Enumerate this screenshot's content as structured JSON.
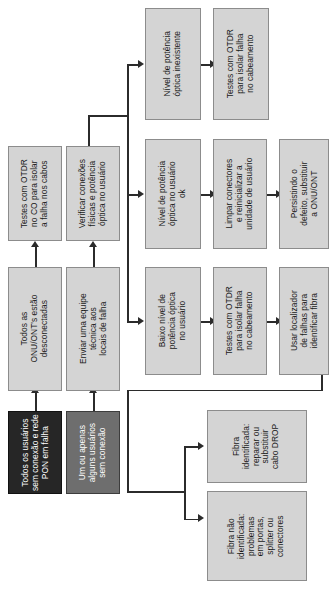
{
  "diagram": {
    "orientation": "rotated-90",
    "colors": {
      "node_fill": "#d4d4d4",
      "node_border": "#8c8c8c",
      "start_primary_fill": "#262626",
      "start_secondary_fill": "#6e6e6e",
      "connector": "#2b2b2b",
      "text_dark": "#1a1a1a",
      "text_light": "#ffffff"
    },
    "nodes": [
      {
        "id": "start-all-users",
        "style": "dark",
        "text": "Todos os usuários\nsem conexão e rede\nPON em falha"
      },
      {
        "id": "start-some-users",
        "style": "mid",
        "text": "Um ou apenas\nalguns usuários\nsem conexão"
      },
      {
        "id": "all-onu-disconnected",
        "style": "normal",
        "text": "Todos as\nONU/ONT's estão\ndesconectadas"
      },
      {
        "id": "send-technical-team",
        "style": "normal",
        "text": "Enviar uma equipe\ntécnica aos\nlocais de falha"
      },
      {
        "id": "otdr-co-tests",
        "style": "normal",
        "text": "Testes com OTDR\nno CO para isolar\na falha nos cabos"
      },
      {
        "id": "check-connections",
        "style": "normal",
        "text": "Verificar conexões\nfísicas e potência\nóptica no usuário"
      },
      {
        "id": "power-nonexistent",
        "style": "normal",
        "text": "Nível de potência\nóptica inexistente"
      },
      {
        "id": "otdr-cabling-tests-a",
        "style": "normal",
        "text": "Testes com OTDR\npara isolar falha\nno cabeamento"
      },
      {
        "id": "power-ok",
        "style": "normal",
        "text": "Nível de potência\nóptica no usuário\nok"
      },
      {
        "id": "clean-connectors",
        "style": "normal",
        "text": "Limpar conectores\ne reinicializar a\nunidade de usuário"
      },
      {
        "id": "replace-onu",
        "style": "normal",
        "text": "Persistindo o\ndefeito, substituir\na ONU/ONT"
      },
      {
        "id": "low-power",
        "style": "normal",
        "text": "Baixo nível de\npotência óptica\nno usuário"
      },
      {
        "id": "otdr-cabling-tests-b",
        "style": "normal",
        "text": "Testes com OTDR\npara isolar falha\nno cabeamento"
      },
      {
        "id": "fault-locator",
        "style": "normal",
        "text": "Usar localizador\nde falhas para\nidentificar fibra"
      },
      {
        "id": "fiber-identified",
        "style": "normal",
        "text": "Fibra\nidentificada:\nreparar ou\nsubstituir\ncabo DROP"
      },
      {
        "id": "fiber-not-identified",
        "style": "normal",
        "text": "Fibra não\nidentificada:\nproblemas\nem portas,\nsplitter ou\nconectores"
      }
    ]
  }
}
